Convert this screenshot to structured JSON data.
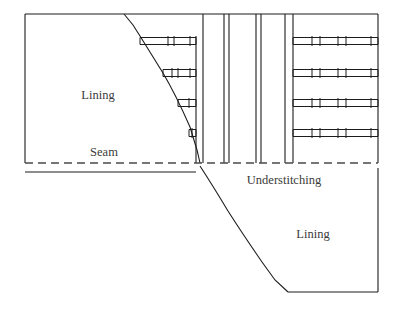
{
  "diagram": {
    "type": "technical-sewing-illustration",
    "canvas": {
      "width": 396,
      "height": 311,
      "background": "#ffffff"
    },
    "colors": {
      "outline": "#1c1c1c",
      "stitch": "#1c1c1c",
      "seam_dashed": "#4a4a4a",
      "text": "#3a3a3a"
    },
    "labels": [
      {
        "id": "lining-upper",
        "text": "Lining",
        "x": 98,
        "y": 99,
        "anchor": "middle",
        "size": 12.5
      },
      {
        "id": "seam",
        "text": "Seam",
        "x": 104,
        "y": 156,
        "anchor": "middle",
        "size": 12.5
      },
      {
        "id": "understitching",
        "text": "Understitching",
        "x": 284,
        "y": 184,
        "anchor": "middle",
        "size": 12.5
      },
      {
        "id": "lining-lower",
        "text": "Lining",
        "x": 313,
        "y": 238,
        "anchor": "middle",
        "size": 12.5
      }
    ],
    "geometry": {
      "top_edge": {
        "x1": 25,
        "y1": 14,
        "x2": 124,
        "y2": 14
      },
      "left_edge": {
        "x1": 25,
        "y1": 14,
        "x2": 25,
        "y2": 163
      },
      "seam_solid_lower": {
        "x1": 25,
        "y1": 172,
        "x2": 196,
        "y2": 172
      },
      "seam_dashed": {
        "x1": 25,
        "y1": 163,
        "x2": 378,
        "y2": 163
      },
      "upper_right_edge": {
        "x1": 378,
        "y1": 14,
        "x2": 378,
        "y2": 163
      },
      "top_edge_right": {
        "x1": 124,
        "y1": 14,
        "x2": 378,
        "y2": 14
      },
      "lower_right_edge": {
        "x1": 378,
        "y1": 168,
        "x2": 378,
        "y2": 292
      },
      "bottom_edge": {
        "x1": 288,
        "y1": 292,
        "x2": 378,
        "y2": 292
      },
      "upper_curve_path": "M 124 14 L 133 25 L 140 36 Q 150 52 163 73 Q 176 95 190 127 L 197 150 L 200 163",
      "lower_curve_path": "M 200 166 Q 213 186 228 211 Q 242 233 262 262 L 275 280 L 288 292",
      "vertical_fold_left": {
        "x": 196,
        "y1": 36,
        "y2": 163
      },
      "vertical_group_divider": {
        "x": 293,
        "y1": 14,
        "y2": 163
      }
    },
    "center_vertical_lines": [
      {
        "id": "fold-line-1",
        "x": 203,
        "y1": 14,
        "y2": 163
      },
      {
        "id": "fold-line-2",
        "x": 224,
        "y1": 14,
        "y2": 163
      },
      {
        "id": "fold-line-3",
        "x": 229,
        "y1": 14,
        "y2": 163
      },
      {
        "id": "fold-line-4",
        "x": 256,
        "y1": 14,
        "y2": 163
      },
      {
        "id": "fold-line-5",
        "x": 261,
        "y1": 14,
        "y2": 163
      },
      {
        "id": "fold-line-6",
        "x": 285,
        "y1": 14,
        "y2": 163
      }
    ],
    "left_stitch_rows": [
      {
        "id": "left-stitch-row-1",
        "y": 41,
        "x_start": 140,
        "x_end": 196,
        "band_height": 7,
        "ticks": [
          168,
          174,
          190
        ]
      },
      {
        "id": "left-stitch-row-2",
        "y": 73,
        "x_start": 163,
        "x_end": 196,
        "band_height": 7,
        "ticks": [
          172,
          178,
          190
        ]
      },
      {
        "id": "left-stitch-row-3",
        "y": 103,
        "x_start": 178,
        "x_end": 196,
        "band_height": 7,
        "ticks": [
          189
        ]
      },
      {
        "id": "left-stitch-row-4",
        "y": 133,
        "x_start": 189,
        "x_end": 196,
        "band_height": 7,
        "ticks": [
          192
        ]
      }
    ],
    "right_stitch_rows": [
      {
        "id": "right-stitch-row-1",
        "y": 41,
        "x_start": 293,
        "x_end": 378,
        "band_height": 7,
        "ticks": [
          312,
          320,
          338,
          346,
          371
        ]
      },
      {
        "id": "right-stitch-row-2",
        "y": 73,
        "x_start": 293,
        "x_end": 378,
        "band_height": 7,
        "ticks": [
          312,
          320,
          338,
          346,
          371
        ]
      },
      {
        "id": "right-stitch-row-3",
        "y": 103,
        "x_start": 293,
        "x_end": 378,
        "band_height": 7,
        "ticks": [
          312,
          320,
          338,
          346,
          371
        ]
      },
      {
        "id": "right-stitch-row-4",
        "y": 133,
        "x_start": 293,
        "x_end": 378,
        "band_height": 7,
        "ticks": [
          312,
          320,
          338,
          346,
          371
        ]
      }
    ],
    "seam_dash_pattern": "8,5"
  }
}
